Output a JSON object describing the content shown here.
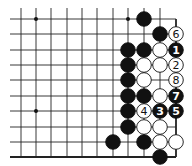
{
  "board": {
    "cols_x": [
      21,
      36,
      51,
      67,
      82,
      97,
      113,
      128,
      144,
      160,
      176
    ],
    "rows_y": [
      19,
      34,
      50,
      65,
      80,
      96,
      111,
      127,
      142,
      157
    ],
    "left_extent": 10,
    "top_extent": 8,
    "right_edge_col": 10,
    "bottom_edge_row": 9,
    "line_color": "#222222",
    "stone_radius": 7.3,
    "hoshi": [
      [
        1,
        0
      ],
      [
        7,
        0
      ],
      [
        1,
        6
      ]
    ]
  },
  "stones": [
    {
      "col": 8,
      "row": 0,
      "color": "black",
      "label": ""
    },
    {
      "col": 9,
      "row": 1,
      "color": "black",
      "label": ""
    },
    {
      "col": 10,
      "row": 1,
      "color": "white",
      "label": "6"
    },
    {
      "col": 7,
      "row": 2,
      "color": "black",
      "label": ""
    },
    {
      "col": 8,
      "row": 2,
      "color": "black",
      "label": ""
    },
    {
      "col": 9,
      "row": 2,
      "color": "white",
      "label": ""
    },
    {
      "col": 10,
      "row": 2,
      "color": "black",
      "label": "1"
    },
    {
      "col": 7,
      "row": 3,
      "color": "black",
      "label": ""
    },
    {
      "col": 8,
      "row": 3,
      "color": "white",
      "label": ""
    },
    {
      "col": 9,
      "row": 3,
      "color": "white",
      "label": ""
    },
    {
      "col": 10,
      "row": 3,
      "color": "white",
      "label": "2"
    },
    {
      "col": 7,
      "row": 4,
      "color": "black",
      "label": ""
    },
    {
      "col": 8,
      "row": 4,
      "color": "white",
      "label": ""
    },
    {
      "col": 10,
      "row": 4,
      "color": "white",
      "label": "8"
    },
    {
      "col": 7,
      "row": 5,
      "color": "black",
      "label": ""
    },
    {
      "col": 8,
      "row": 5,
      "color": "black",
      "label": ""
    },
    {
      "col": 9,
      "row": 5,
      "color": "white",
      "label": ""
    },
    {
      "col": 10,
      "row": 5,
      "color": "black",
      "label": "7"
    },
    {
      "col": 7,
      "row": 6,
      "color": "black",
      "label": ""
    },
    {
      "col": 8,
      "row": 6,
      "color": "white",
      "label": "4"
    },
    {
      "col": 9,
      "row": 6,
      "color": "black",
      "label": "3"
    },
    {
      "col": 10,
      "row": 6,
      "color": "black",
      "label": "5"
    },
    {
      "col": 7,
      "row": 7,
      "color": "black",
      "label": ""
    },
    {
      "col": 8,
      "row": 7,
      "color": "white",
      "label": ""
    },
    {
      "col": 9,
      "row": 7,
      "color": "white",
      "label": ""
    },
    {
      "col": 6,
      "row": 8,
      "color": "black",
      "label": ""
    },
    {
      "col": 8,
      "row": 8,
      "color": "black",
      "label": ""
    },
    {
      "col": 9,
      "row": 8,
      "color": "white",
      "label": ""
    },
    {
      "col": 10,
      "row": 8,
      "color": "white",
      "label": ""
    },
    {
      "col": 9,
      "row": 9,
      "color": "black",
      "label": ""
    }
  ]
}
